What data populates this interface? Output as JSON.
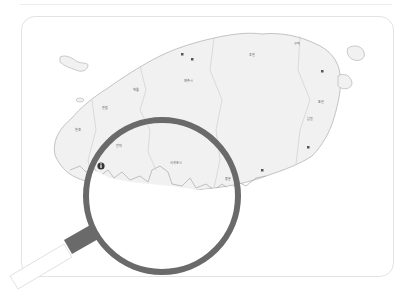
{
  "figure": {
    "colors": {
      "land": "#f1f1f1",
      "coast": "#b5b5b5",
      "border": "#c9c9c9",
      "lens_ring": "#6a6a6a",
      "handle_collar": "#6a6a6a",
      "handle": "#ffffff",
      "card_border": "#e3e3e3",
      "marker": "#333333"
    },
    "lens": {
      "cx": 162,
      "cy": 196,
      "r": 76,
      "ring_width": 6
    },
    "markers": [
      {
        "name": "info-marker",
        "x": 101,
        "y": 166,
        "glyph": "i"
      },
      {
        "name": "city-marker-1",
        "x": 182,
        "y": 54
      },
      {
        "name": "city-marker-2",
        "x": 192,
        "y": 59
      },
      {
        "name": "city-marker-3",
        "x": 322,
        "y": 71
      },
      {
        "name": "city-marker-4",
        "x": 308,
        "y": 147
      },
      {
        "name": "city-marker-5",
        "x": 262,
        "y": 170
      }
    ],
    "labels": [
      {
        "text": "제주시",
        "x": 184,
        "y": 82
      },
      {
        "text": "애월",
        "x": 133,
        "y": 91
      },
      {
        "text": "한림",
        "x": 102,
        "y": 109
      },
      {
        "text": "한경",
        "x": 75,
        "y": 131
      },
      {
        "text": "안덕",
        "x": 116,
        "y": 147
      },
      {
        "text": "조천",
        "x": 249,
        "y": 56
      },
      {
        "text": "구좌",
        "x": 294,
        "y": 45
      },
      {
        "text": "표선",
        "x": 318,
        "y": 103
      },
      {
        "text": "남원",
        "x": 307,
        "y": 120
      },
      {
        "text": "서귀포시",
        "x": 170,
        "y": 164
      },
      {
        "text": "중문",
        "x": 225,
        "y": 180
      }
    ]
  }
}
